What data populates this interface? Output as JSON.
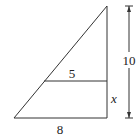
{
  "diagram": {
    "type": "geometry",
    "shape": "right triangle with parallel segment",
    "labels": {
      "top_segment": "5",
      "base": "8",
      "height": "10",
      "lower_side": "x"
    },
    "colors": {
      "stroke": "#333333",
      "background": "#ffffff"
    }
  }
}
